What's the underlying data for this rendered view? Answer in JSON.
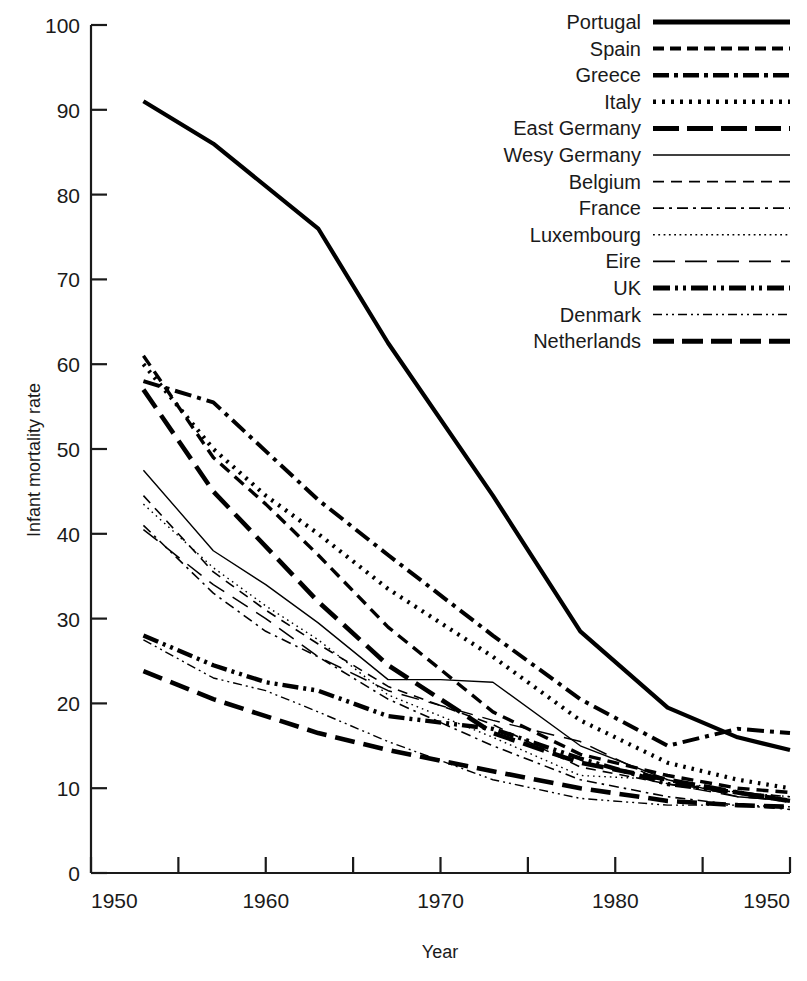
{
  "chart_data": {
    "type": "line",
    "title": "",
    "xlabel": "Year",
    "ylabel": "Infant mortality rate",
    "xlim": [
      1950,
      1990
    ],
    "ylim": [
      0,
      100
    ],
    "grid": false,
    "legend_position": "top-right",
    "x_tick_labels": [
      "1950",
      "",
      "1960",
      "",
      "1970",
      "",
      "1980",
      "",
      "1950"
    ],
    "x_ticks": [
      1950,
      1955,
      1960,
      1965,
      1970,
      1975,
      1980,
      1985,
      1990
    ],
    "y_ticks": [
      0,
      10,
      20,
      30,
      40,
      50,
      60,
      70,
      80,
      90,
      100
    ],
    "y_tick_labels": [
      "0",
      "10",
      "20",
      "30",
      "40",
      "50",
      "60",
      "70",
      "80",
      "90",
      "100"
    ],
    "note_rightmost_xlabel_typo": "1950",
    "series": [
      {
        "name": "Portugal",
        "dash": "none",
        "width": 4.2,
        "x": [
          1953,
          1957,
          1963,
          1967,
          1973,
          1978,
          1983,
          1987,
          1990
        ],
        "values": [
          91.0,
          86.0,
          76.0,
          62.5,
          44.5,
          28.5,
          19.5,
          16.0,
          14.5
        ]
      },
      {
        "name": "Spain",
        "dash": "12,7",
        "width": 3.4,
        "x": [
          1953,
          1957,
          1960,
          1963,
          1967,
          1973,
          1978,
          1983,
          1987,
          1990
        ],
        "values": [
          61.0,
          49.0,
          43.5,
          37.5,
          29.0,
          19.0,
          14.0,
          11.5,
          10.0,
          9.5
        ]
      },
      {
        "name": "Greece",
        "dash": "17,6,4,6",
        "width": 4.0,
        "x": [
          1953,
          1957,
          1963,
          1967,
          1973,
          1978,
          1983,
          1987,
          1990
        ],
        "values": [
          58.0,
          55.5,
          44.0,
          37.5,
          28.0,
          20.5,
          15.0,
          17.0,
          16.5
        ]
      },
      {
        "name": "Italy",
        "dash": "2.5,6",
        "width": 4.2,
        "x": [
          1953,
          1957,
          1960,
          1963,
          1967,
          1973,
          1978,
          1983,
          1987,
          1990
        ],
        "values": [
          60.0,
          50.0,
          44.5,
          40.0,
          33.5,
          25.5,
          18.0,
          13.0,
          11.0,
          10.0
        ]
      },
      {
        "name": "East Germany",
        "dash": "22,9",
        "width": 4.6,
        "x": [
          1953,
          1957,
          1963,
          1967,
          1973,
          1978,
          1983,
          1987,
          1990
        ],
        "values": [
          57.0,
          45.0,
          32.0,
          24.5,
          16.5,
          13.0,
          11.0,
          9.5,
          8.5
        ]
      },
      {
        "name": "Wesy Germany",
        "dash": "none",
        "width": 1.4,
        "x": [
          1953,
          1957,
          1960,
          1963,
          1967,
          1970,
          1973,
          1978,
          1983,
          1987,
          1990
        ],
        "values": [
          47.5,
          38.0,
          34.0,
          29.5,
          22.8,
          22.8,
          22.5,
          15.0,
          11.0,
          9.0,
          8.5
        ]
      },
      {
        "name": "Belgium",
        "dash": "10,7",
        "width": 1.6,
        "x": [
          1953,
          1957,
          1960,
          1963,
          1967,
          1973,
          1978,
          1983,
          1987,
          1990
        ],
        "values": [
          44.5,
          35.5,
          31.0,
          27.0,
          22.0,
          17.5,
          12.5,
          10.5,
          9.5,
          9.0
        ]
      },
      {
        "name": "France",
        "dash": "10,5,2.5,5",
        "width": 1.6,
        "x": [
          1953,
          1957,
          1960,
          1963,
          1967,
          1973,
          1978,
          1983,
          1987,
          1990
        ],
        "values": [
          41.0,
          33.0,
          28.5,
          25.5,
          20.5,
          15.0,
          11.0,
          9.0,
          8.0,
          7.5
        ]
      },
      {
        "name": "Luxembourg",
        "dash": "1.6,4",
        "width": 1.4,
        "x": [
          1953,
          1957,
          1960,
          1963,
          1967,
          1973,
          1978,
          1983,
          1987,
          1990
        ],
        "values": [
          43.5,
          36.0,
          31.5,
          27.5,
          21.0,
          16.0,
          11.5,
          11.0,
          9.5,
          9.0
        ]
      },
      {
        "name": "Eire",
        "dash": "18,10",
        "width": 1.5,
        "x": [
          1953,
          1957,
          1960,
          1963,
          1967,
          1973,
          1978,
          1983,
          1987,
          1990
        ],
        "values": [
          40.5,
          34.0,
          30.0,
          25.5,
          21.5,
          18.0,
          15.5,
          10.5,
          9.0,
          8.5
        ]
      },
      {
        "name": "UK",
        "dash": "16,5,3,5,3,5",
        "width": 4.4,
        "x": [
          1953,
          1957,
          1960,
          1963,
          1967,
          1973,
          1978,
          1983,
          1987,
          1990
        ],
        "values": [
          28.0,
          24.5,
          22.5,
          21.5,
          18.5,
          17.0,
          13.5,
          10.5,
          9.5,
          8.5
        ]
      },
      {
        "name": "Denmark",
        "dash": "9,4,2,4,2,4",
        "width": 1.4,
        "x": [
          1953,
          1957,
          1960,
          1963,
          1967,
          1973,
          1978,
          1983,
          1987,
          1990
        ],
        "values": [
          27.5,
          23.0,
          21.5,
          19.0,
          15.5,
          11.0,
          8.8,
          8.0,
          8.0,
          7.8
        ]
      },
      {
        "name": "Netherlands",
        "dash": "20,9",
        "width": 4.6,
        "x": [
          1953,
          1957,
          1960,
          1963,
          1967,
          1973,
          1978,
          1983,
          1987,
          1990
        ],
        "values": [
          23.8,
          20.5,
          18.5,
          16.5,
          14.5,
          12.0,
          10.0,
          8.5,
          8.0,
          7.8
        ]
      }
    ]
  },
  "legend": {
    "entries": [
      {
        "label": "Portugal",
        "dash": "none",
        "width": 5.0
      },
      {
        "label": "Spain",
        "dash": "11,6",
        "width": 4.0
      },
      {
        "label": "Greece",
        "dash": "16,5,4,5",
        "width": 4.4
      },
      {
        "label": "Italy",
        "dash": "3,6",
        "width": 4.6
      },
      {
        "label": "East Germany",
        "dash": "26,8",
        "width": 5.0
      },
      {
        "label": "Wesy Germany",
        "dash": "none",
        "width": 1.4
      },
      {
        "label": "Belgium",
        "dash": "11,7",
        "width": 1.7
      },
      {
        "label": "France",
        "dash": "11,5,3,5",
        "width": 1.7
      },
      {
        "label": "Luxembourg",
        "dash": "1.8,3.5",
        "width": 1.4
      },
      {
        "label": "Eire",
        "dash": "22,10",
        "width": 1.6
      },
      {
        "label": "UK",
        "dash": "17,5,3,5,3,5",
        "width": 4.8
      },
      {
        "label": "Denmark",
        "dash": "9,4,2,4,2,4",
        "width": 1.5
      },
      {
        "label": "Netherlands",
        "dash": "21,8",
        "width": 5.0
      }
    ]
  },
  "colors": {
    "line": "#000000",
    "axis": "#1a1a1a",
    "background": "#ffffff"
  }
}
